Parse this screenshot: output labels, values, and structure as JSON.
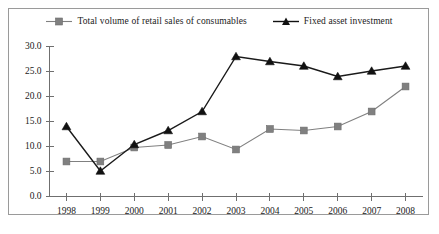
{
  "chart_data": {
    "type": "line",
    "title": "",
    "xlabel": "",
    "ylabel": "",
    "ylim": [
      0,
      30
    ],
    "ytick_labels": [
      "30.0",
      "25.0",
      "20.0",
      "15.0",
      "10.0",
      "5.0",
      "0.0"
    ],
    "ytick_values": [
      30,
      25,
      20,
      15,
      10,
      5,
      0
    ],
    "grid": false,
    "legend_position": "top-center",
    "categories": [
      "1998",
      "1999",
      "2000",
      "2001",
      "2002",
      "2003",
      "2004",
      "2005",
      "2006",
      "2007",
      "2008"
    ],
    "series": [
      {
        "name": "Total volume of retail sales of consumables",
        "marker": "square",
        "color": "#808080",
        "values": [
          7.0,
          7.0,
          9.8,
          10.3,
          12.0,
          9.4,
          13.5,
          13.2,
          14.0,
          17.0,
          22.0
        ]
      },
      {
        "name": "Fixed asset investment",
        "marker": "triangle",
        "color": "#111111",
        "values": [
          14.0,
          5.1,
          10.4,
          13.2,
          17.0,
          28.0,
          27.0,
          26.1,
          24.0,
          25.1,
          26.1
        ]
      }
    ]
  },
  "legend": {
    "entries": [
      {
        "label": "Total volume of retail sales of consumables",
        "marker": "square-marker-icon",
        "color": "#808080"
      },
      {
        "label": "Fixed asset investment",
        "marker": "triangle-marker-icon",
        "color": "#111111"
      }
    ]
  },
  "colors": {
    "frame_border": "#9a9a9a",
    "axis": "#6f6f6f",
    "series_a": "#808080",
    "series_b": "#111111",
    "background": "#ffffff"
  }
}
